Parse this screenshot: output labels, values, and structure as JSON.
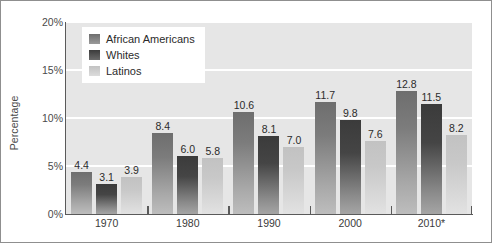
{
  "chart_data": {
    "type": "bar",
    "title": "",
    "xlabel": "",
    "ylabel": "Percentage",
    "ylim": [
      0,
      20
    ],
    "yticks": [
      "0%",
      "5%",
      "10%",
      "15%",
      "20%"
    ],
    "ytick_values": [
      0,
      5,
      10,
      15,
      20
    ],
    "grid": true,
    "legend_position": "top-left",
    "categories": [
      "1970",
      "1980",
      "1990",
      "2000",
      "2010*"
    ],
    "series": [
      {
        "name": "African Americans",
        "color": "#7c7c7c",
        "values": [
          4.4,
          8.4,
          10.6,
          11.7,
          12.8
        ],
        "labels": [
          "4.4",
          "8.4",
          "10.6",
          "11.7",
          "12.8"
        ]
      },
      {
        "name": "Whites",
        "color": "#454545",
        "values": [
          3.1,
          6.0,
          8.1,
          9.8,
          11.5
        ],
        "labels": [
          "3.1",
          "6.0",
          "8.1",
          "9.8",
          "11.5"
        ]
      },
      {
        "name": "Latinos",
        "color": "#c8c8c8",
        "values": [
          3.9,
          5.8,
          7.0,
          7.6,
          8.2
        ],
        "labels": [
          "3.9",
          "5.8",
          "7.0",
          "7.6",
          "8.2"
        ]
      }
    ]
  },
  "figure": {
    "background_color": "#ffffff",
    "plot_background_color": "#e6e6e6",
    "gridline_color": "#ffffff",
    "axis_color": "#5a5a5a",
    "border_color": "#8f8f8f"
  }
}
